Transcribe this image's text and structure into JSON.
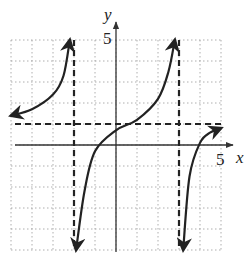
{
  "chart_data": {
    "type": "line",
    "title": "",
    "xlabel": "x",
    "ylabel": "y",
    "xlim": [
      -5,
      5
    ],
    "ylim": [
      -5,
      5
    ],
    "grid": true,
    "grid_style": "dotted",
    "tick_labels": {
      "x": [
        "5"
      ],
      "y": [
        "5"
      ]
    },
    "asymptotes": {
      "vertical": [
        -2,
        3
      ],
      "horizontal": [
        1
      ]
    },
    "series": [
      {
        "name": "left-branch",
        "points": [
          [
            -5,
            1.4
          ],
          [
            -4,
            1.7
          ],
          [
            -3,
            2.4
          ],
          [
            -2.5,
            3.3
          ],
          [
            -2.2,
            5
          ]
        ],
        "arrow_ends": [
          "left",
          "up"
        ]
      },
      {
        "name": "middle-branch",
        "points": [
          [
            -1.9,
            -5
          ],
          [
            -1.5,
            -2.2
          ],
          [
            -1,
            -0.3
          ],
          [
            0,
            0.7
          ],
          [
            1,
            1.2
          ],
          [
            2,
            2.2
          ],
          [
            2.5,
            3.5
          ],
          [
            2.8,
            5
          ]
        ],
        "arrow_ends": [
          "down",
          "up"
        ]
      },
      {
        "name": "right-branch",
        "points": [
          [
            3.2,
            -5
          ],
          [
            3.5,
            -1.5
          ],
          [
            4,
            0.1
          ],
          [
            4.5,
            0.6
          ],
          [
            5,
            0.8
          ]
        ],
        "arrow_ends": [
          "down",
          "right"
        ]
      }
    ]
  },
  "labels": {
    "x_axis": "x",
    "y_axis": "y",
    "x_tick": "5",
    "y_tick": "5"
  },
  "colors": {
    "curve": "#222222",
    "grid": "#9a9a9a",
    "axis": "#333333"
  }
}
